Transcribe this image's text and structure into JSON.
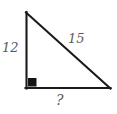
{
  "figure": {
    "kind": "right-triangle-diagram",
    "background_color": "#ffffff",
    "stroke_color": "#1a1a1a",
    "label_color": "#5b5b5b",
    "labels": {
      "vertical_leg": "12",
      "hypotenuse": "15",
      "horizontal_leg": "?"
    },
    "right_angle_marker": {
      "name": "right-angle-square",
      "vertex": "bottom-left"
    },
    "vertices": {
      "top": [
        26,
        12
      ],
      "bottom_left": [
        26,
        88
      ],
      "bottom_right": [
        110,
        88
      ]
    }
  }
}
